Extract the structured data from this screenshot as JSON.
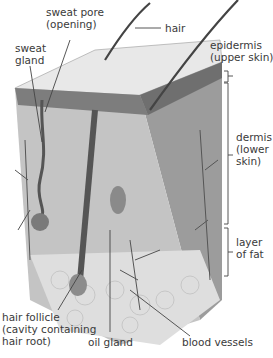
{
  "diagram": {
    "labels": {
      "sweat_pore": "sweat pore\n(opening)",
      "hair": "hair",
      "sweat_gland": "sweat\ngland",
      "epidermis": "epidermis\n(upper skin)",
      "dermis": "dermis\n(lower\nskin)",
      "fat": "layer\nof fat",
      "hair_follicle": "hair follicle\n(cavity containing\nhair root)",
      "oil_gland": "oil gland",
      "blood_vessels": "blood vessels"
    },
    "colors": {
      "surface": "#e6e6e6",
      "epidermis_band": "#8a8a8a",
      "dermis": "#bdbdbd",
      "fat": "#dcdcdc",
      "lines": "#333333"
    }
  }
}
